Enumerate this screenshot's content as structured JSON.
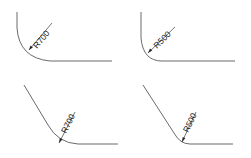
{
  "figures": [
    {
      "id": "top-left",
      "label": "R700",
      "style": "vertical-to-horizontal"
    },
    {
      "id": "top-right",
      "label": "R500",
      "style": "vertical-to-horizontal"
    },
    {
      "id": "bottom-left",
      "label": "R700",
      "style": "slanted-to-horizontal"
    },
    {
      "id": "bottom-right",
      "label": "R500",
      "style": "slanted-to-horizontal"
    }
  ],
  "colors": {
    "line": "#6a6a6a",
    "dimension": "#3a3a3a",
    "text": "#222222"
  }
}
